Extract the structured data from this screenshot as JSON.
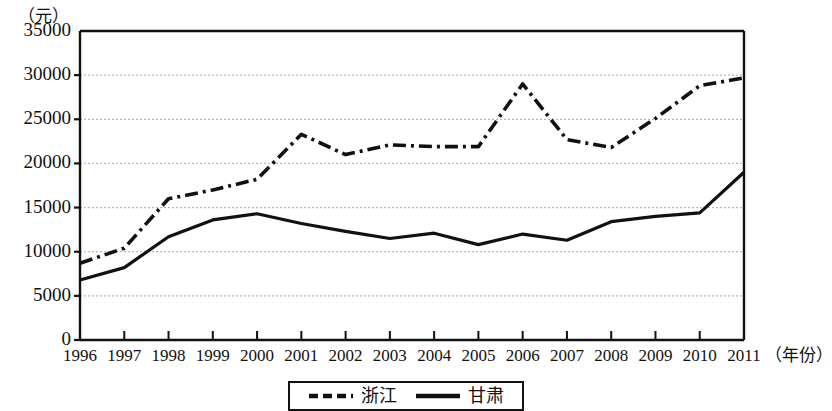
{
  "chart_data": {
    "type": "line",
    "title": "",
    "subtitle": "",
    "xlabel": "（年份）",
    "ylabel": "（元）",
    "x": [
      1996,
      1997,
      1998,
      1999,
      2000,
      2001,
      2002,
      2003,
      2004,
      2005,
      2006,
      2007,
      2008,
      2009,
      2010,
      2011
    ],
    "categories": [
      "1996",
      "1997",
      "1998",
      "1999",
      "2000",
      "2001",
      "2002",
      "2003",
      "2004",
      "2005",
      "2006",
      "2007",
      "2008",
      "2009",
      "2010",
      "2011"
    ],
    "series": [
      {
        "name": "浙江",
        "style": "dash-dot",
        "color": "#111111",
        "values": [
          8700,
          10400,
          16000,
          17000,
          18200,
          23300,
          21000,
          22100,
          21900,
          21900,
          29000,
          22700,
          21800,
          25100,
          28800,
          29700
        ]
      },
      {
        "name": "甘肃",
        "style": "solid",
        "color": "#111111",
        "values": [
          6800,
          8200,
          11700,
          13600,
          14300,
          13200,
          12300,
          11500,
          12100,
          10800,
          12000,
          11300,
          13400,
          14000,
          14400,
          19000
        ]
      }
    ],
    "ylim": [
      0,
      35000
    ],
    "yticks": [
      0,
      5000,
      10000,
      15000,
      20000,
      25000,
      30000,
      35000
    ],
    "ytick_labels": [
      "0",
      "5000",
      "10000",
      "15000",
      "20000",
      "25000",
      "30000",
      "35000"
    ],
    "xlim": [
      1996,
      2011
    ],
    "grid": true,
    "grid_axis": "y",
    "legend_position": "bottom-center",
    "legend_entries": [
      "浙江",
      "甘肃"
    ]
  },
  "axes": {
    "unit_label": "（元）",
    "x_axis_title": "（年份）"
  },
  "legend": {
    "entries": [
      {
        "label": "浙江",
        "style": "dash-dot"
      },
      {
        "label": "甘肃",
        "style": "solid"
      }
    ]
  }
}
